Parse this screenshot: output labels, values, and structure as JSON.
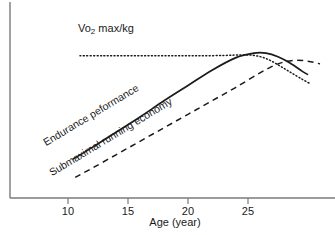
{
  "chart_data": {
    "type": "line",
    "title": "",
    "xlabel": "Age (year)",
    "ylabel": "",
    "xlim": [
      7.5,
      30.5
    ],
    "ylim": [
      0,
      100
    ],
    "xticks": [
      10,
      15,
      20,
      25
    ],
    "xtick_labels": [
      "10",
      "15",
      "20",
      "25"
    ],
    "grid": false,
    "legend_position": "inline-annotations",
    "axis_color": "#6e6e6e",
    "line_color": "#1a1a1a",
    "series": [
      {
        "name": "Vo2 max/kg",
        "style": "dotted",
        "label_text": "Vo2 max/kg",
        "x": [
          11.0,
          13.0,
          15.0,
          17.0,
          19.0,
          21.0,
          23.0,
          24.5,
          25.5,
          26.5,
          27.5,
          28.5,
          29.5,
          30.2
        ],
        "y": [
          79.0,
          79.0,
          79.0,
          79.0,
          79.0,
          79.0,
          79.2,
          79.5,
          79.2,
          77.5,
          74.0,
          70.0,
          66.0,
          63.5
        ]
      },
      {
        "name": "Endurance peformance",
        "style": "solid",
        "label_text": "Endurance peformance",
        "x": [
          10.4,
          12.0,
          14.0,
          16.0,
          18.0,
          20.0,
          22.0,
          24.0,
          25.5,
          26.5,
          27.5,
          28.5,
          29.5,
          30.0
        ],
        "y": [
          21.5,
          28.0,
          36.5,
          45.0,
          54.0,
          62.5,
          71.0,
          78.0,
          80.5,
          80.5,
          78.5,
          75.0,
          70.5,
          68.5
        ]
      },
      {
        "name": "Submaximal running economy",
        "style": "dashed",
        "label_text": "Submaximal running economy",
        "x": [
          10.6,
          12.0,
          14.0,
          16.0,
          18.0,
          20.0,
          22.0,
          24.0,
          26.0,
          27.5,
          28.8,
          30.0,
          31.0
        ],
        "y": [
          11.5,
          16.5,
          24.0,
          31.5,
          39.0,
          46.5,
          54.0,
          61.5,
          69.5,
          74.5,
          76.5,
          76.0,
          74.5
        ]
      }
    ]
  },
  "axis": {
    "x_title": "Age (year)",
    "tick_labels": [
      "10",
      "15",
      "20",
      "25"
    ]
  },
  "annotations": {
    "vo2_prefix": "Vo",
    "vo2_sub": "2",
    "vo2_suffix": " max/kg",
    "endurance": "Endurance peformance",
    "economy": "Submaximal running economy"
  }
}
